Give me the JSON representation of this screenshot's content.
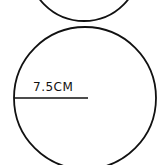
{
  "diagram": {
    "type": "circles",
    "shapes": [
      {
        "name": "top-circle",
        "partial": true,
        "center": [
          84,
          -35
        ],
        "radius": 56
      },
      {
        "name": "main-circle",
        "center": [
          85,
          98
        ],
        "radius": 71,
        "radius_line": {
          "from": [
            14,
            98
          ],
          "to": [
            88,
            98
          ]
        }
      }
    ],
    "radius_label": "7.5CM",
    "stroke_color": "#111111",
    "background": "#ffffff"
  }
}
